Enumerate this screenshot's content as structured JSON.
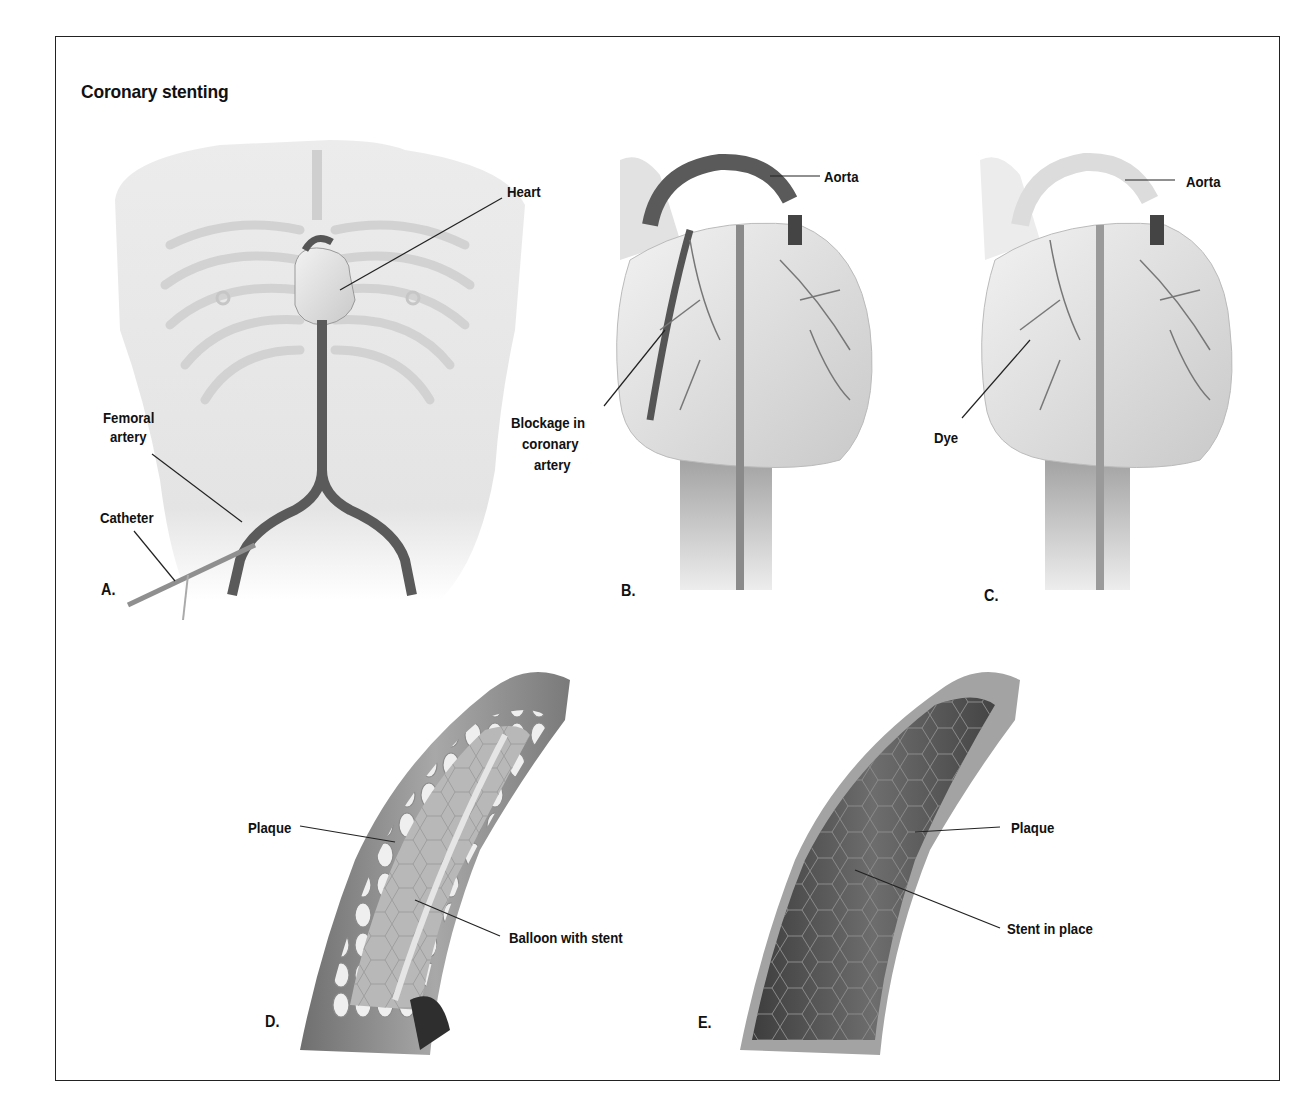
{
  "figure": {
    "title": "Coronary stenting",
    "panels": [
      {
        "id": "A",
        "letter": "A.",
        "labels": {
          "heart": "Heart",
          "femoral_line1": "Femoral",
          "femoral_line2": "artery",
          "catheter": "Catheter"
        }
      },
      {
        "id": "B",
        "letter": "B.",
        "labels": {
          "aorta": "Aorta",
          "blockage_line1": "Blockage in",
          "blockage_line2": "coronary",
          "blockage_line3": "artery"
        }
      },
      {
        "id": "C",
        "letter": "C.",
        "labels": {
          "aorta": "Aorta",
          "dye": "Dye"
        }
      },
      {
        "id": "D",
        "letter": "D.",
        "labels": {
          "plaque": "Plaque",
          "balloon": "Balloon with stent"
        }
      },
      {
        "id": "E",
        "letter": "E.",
        "labels": {
          "plaque": "Plaque",
          "stent": "Stent in place"
        }
      }
    ]
  },
  "colors": {
    "border": "#222222",
    "text": "#111111",
    "body_fill": "#e6e6e6",
    "artery_dark": "#555555",
    "heart_fill": "#d9d9d9",
    "plaque_fill": "#e8e8e8",
    "vessel_wall": "#9a9a9a"
  }
}
